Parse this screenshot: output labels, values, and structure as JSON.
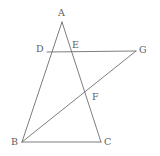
{
  "figure": {
    "kind": "geometry-diagram",
    "background_color": "#ffffff",
    "stroke_color": "#6e6e6e",
    "label_color": "#5d5d5d",
    "stroke_width": 0.9,
    "canvas": {
      "width": 160,
      "height": 156
    },
    "points": [
      {
        "id": "A",
        "label": "A",
        "x": 62,
        "y": 22,
        "label_x": 58,
        "label_y": 8
      },
      {
        "id": "B",
        "label": "B",
        "x": 22,
        "y": 142,
        "label_x": 11,
        "label_y": 137
      },
      {
        "id": "C",
        "label": "C",
        "x": 101,
        "y": 142,
        "label_x": 104,
        "label_y": 137
      },
      {
        "id": "D",
        "label": "D",
        "x": 47,
        "y": 52,
        "label_x": 36,
        "label_y": 44
      },
      {
        "id": "E",
        "label": "E",
        "x": 73,
        "y": 52,
        "label_x": 72,
        "label_y": 40
      },
      {
        "id": "F",
        "label": "F",
        "x": 89,
        "y": 93,
        "label_x": 92,
        "label_y": 92
      },
      {
        "id": "G",
        "label": "G",
        "x": 136,
        "y": 51,
        "label_x": 139,
        "label_y": 45
      }
    ],
    "segments": [
      {
        "id": "AB",
        "name": "segment-ab",
        "from": "A",
        "to": "B"
      },
      {
        "id": "AC",
        "name": "segment-ac",
        "from": "A",
        "to": "C"
      },
      {
        "id": "BC",
        "name": "segment-bc",
        "from": "B",
        "to": "C"
      },
      {
        "id": "DG",
        "name": "segment-dg",
        "from": "D",
        "to": "G"
      },
      {
        "id": "BG",
        "name": "segment-bg",
        "from": "B",
        "to": "G"
      }
    ]
  }
}
